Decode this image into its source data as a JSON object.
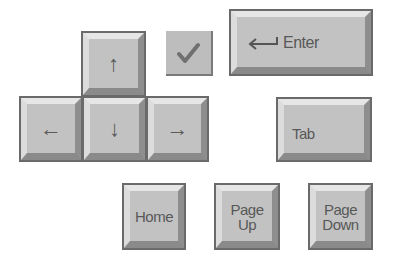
{
  "keys": {
    "up": {
      "glyph": "↑"
    },
    "left": {
      "glyph": "←"
    },
    "down": {
      "glyph": "↓"
    },
    "right": {
      "glyph": "→"
    },
    "enter": {
      "glyph": "⟵",
      "label": "Enter"
    },
    "tab": {
      "label": "Tab"
    },
    "home": {
      "label": "Home"
    },
    "page_up": {
      "line1": "Page",
      "line2": "Up"
    },
    "page_down": {
      "line1": "Page",
      "line2": "Down"
    }
  },
  "check": {
    "icon": "checkmark-icon"
  },
  "colors": {
    "key_face": "#c2c2c2",
    "key_border": "#6a6a6a",
    "text": "#555555"
  }
}
